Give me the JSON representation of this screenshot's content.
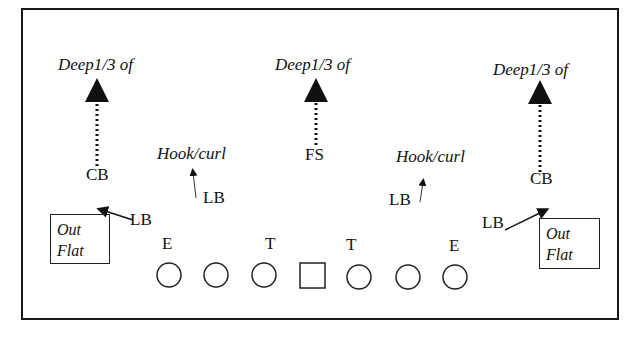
{
  "diagram": {
    "zones": {
      "deep_left": "Deep1/3 of",
      "deep_middle": "Deep1/3 of",
      "deep_right": "Deep1/3 of",
      "hook_left": "Hook/curl",
      "hook_right": "Hook/curl",
      "flat_left": [
        "Out",
        "Flat"
      ],
      "flat_right": [
        "Out",
        "Flat"
      ]
    },
    "defenders": {
      "cb_left": "CB",
      "fs": "FS",
      "cb_right": "CB",
      "lb_hook_left": "LB",
      "lb_hook_right": "LB",
      "lb_flat_left": "LB",
      "lb_flat_right": "LB"
    },
    "line": {
      "e_left": "E",
      "t_left": "T",
      "t_right": "T",
      "e_right": "E"
    },
    "offense": {
      "players": [
        "circle",
        "circle",
        "circle",
        "square",
        "circle",
        "circle",
        "circle"
      ]
    }
  }
}
